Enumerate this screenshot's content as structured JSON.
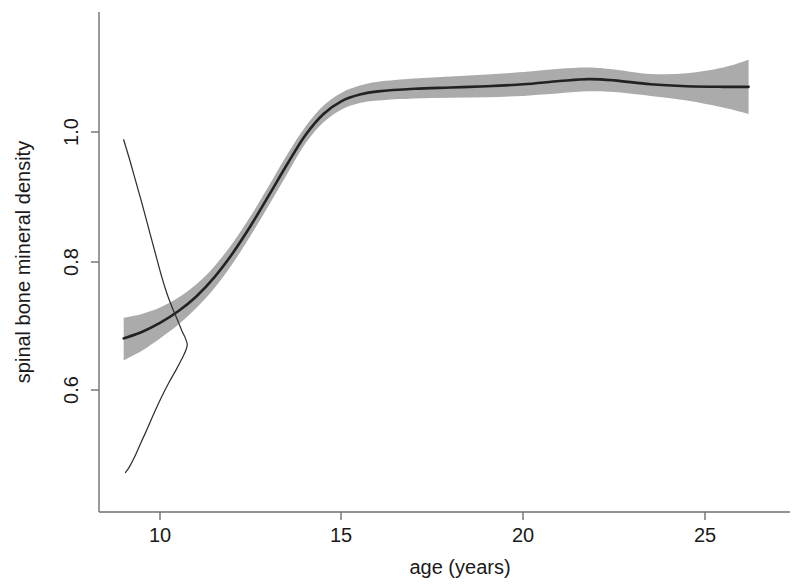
{
  "chart_data": {
    "type": "line",
    "title": "",
    "subtitle": "",
    "xlabel": "age (years)",
    "ylabel": "spinal bone mineral density",
    "xlim": [
      8.4,
      27.0
    ],
    "ylim": [
      0.46,
      1.18
    ],
    "grid": false,
    "legend": null,
    "xticks": [
      10,
      15,
      20,
      25
    ],
    "xtick_labels": [
      "10",
      "15",
      "20",
      "25"
    ],
    "yticks": [
      0.6,
      0.8,
      1.0
    ],
    "ytick_labels": [
      "0.6",
      "0.8",
      "1.0"
    ],
    "colors": {
      "fit_line": "#222222",
      "confidence_band": "#ababab",
      "density_line": "#303030",
      "axis": "#6f6f6f",
      "background": "#ffffff"
    },
    "series": [
      {
        "name": "smoothing spline fit",
        "style": "line",
        "x": [
          9.0,
          9.5,
          10.0,
          10.5,
          11.0,
          11.5,
          12.0,
          12.5,
          13.0,
          13.5,
          14.0,
          14.5,
          15.0,
          15.5,
          16.0,
          17.0,
          18.0,
          19.0,
          20.0,
          21.0,
          21.8,
          22.5,
          23.5,
          24.5,
          25.5,
          26.2
        ],
        "values": [
          0.68,
          0.69,
          0.704,
          0.722,
          0.745,
          0.775,
          0.812,
          0.855,
          0.902,
          0.95,
          0.995,
          1.028,
          1.048,
          1.058,
          1.063,
          1.067,
          1.069,
          1.071,
          1.074,
          1.079,
          1.082,
          1.08,
          1.074,
          1.071,
          1.07,
          1.07
        ]
      },
      {
        "name": "upper 95% confidence limit",
        "style": "band-edge",
        "x": [
          9.0,
          9.5,
          10.0,
          10.5,
          11.0,
          11.5,
          12.0,
          12.5,
          13.0,
          13.5,
          14.0,
          14.5,
          15.0,
          15.5,
          16.0,
          17.0,
          18.0,
          19.0,
          20.0,
          21.0,
          21.8,
          22.5,
          23.5,
          24.5,
          25.5,
          26.2
        ],
        "values": [
          0.712,
          0.718,
          0.728,
          0.743,
          0.764,
          0.792,
          0.828,
          0.87,
          0.917,
          0.965,
          1.008,
          1.041,
          1.061,
          1.072,
          1.078,
          1.083,
          1.086,
          1.089,
          1.093,
          1.098,
          1.1,
          1.097,
          1.09,
          1.091,
          1.1,
          1.112
        ]
      },
      {
        "name": "lower 95% confidence limit",
        "style": "band-edge",
        "x": [
          9.0,
          9.5,
          10.0,
          10.5,
          11.0,
          11.5,
          12.0,
          12.5,
          13.0,
          13.5,
          14.0,
          14.5,
          15.0,
          15.5,
          16.0,
          17.0,
          18.0,
          19.0,
          20.0,
          21.0,
          21.8,
          22.5,
          23.5,
          24.5,
          25.5,
          26.2
        ],
        "values": [
          0.646,
          0.661,
          0.68,
          0.701,
          0.727,
          0.758,
          0.796,
          0.84,
          0.887,
          0.935,
          0.982,
          1.015,
          1.035,
          1.045,
          1.049,
          1.052,
          1.053,
          1.054,
          1.056,
          1.06,
          1.063,
          1.062,
          1.056,
          1.049,
          1.038,
          1.028
        ]
      },
      {
        "name": "density curve",
        "style": "thin-line",
        "x": [
          9.0,
          9.15,
          9.3,
          9.5,
          9.7,
          9.9,
          10.05,
          10.2,
          10.35,
          10.5,
          10.6,
          10.7,
          10.75,
          10.7,
          10.6,
          10.45,
          10.25,
          10.05,
          9.85,
          9.65,
          9.45,
          9.3,
          9.15,
          9.05
        ],
        "values": [
          0.988,
          0.96,
          0.93,
          0.89,
          0.848,
          0.806,
          0.775,
          0.748,
          0.726,
          0.706,
          0.692,
          0.68,
          0.67,
          0.66,
          0.648,
          0.632,
          0.612,
          0.59,
          0.566,
          0.54,
          0.515,
          0.496,
          0.48,
          0.472
        ]
      }
    ],
    "annotations": []
  },
  "axis": {
    "x_title": "age (years)",
    "y_title": "spinal bone mineral density",
    "x_tick_0": "10",
    "x_tick_1": "15",
    "x_tick_2": "20",
    "x_tick_3": "25",
    "y_tick_0": "1.0",
    "y_tick_1": "0.8",
    "y_tick_2": "0.6"
  }
}
